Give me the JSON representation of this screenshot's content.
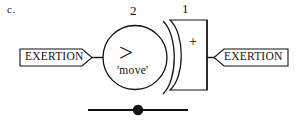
{
  "figure": {
    "label": "c.",
    "caption": ""
  },
  "blocks": {
    "exertion_left": {
      "label": "EXERTION",
      "shape": "right-pointing-flag",
      "x": 20,
      "y": 49,
      "w": 72,
      "h": 17
    },
    "exertion_right": {
      "label": "EXERTION",
      "shape": "left-notched-flag",
      "x": 214,
      "y": 49,
      "w": 74,
      "h": 17
    }
  },
  "element": {
    "circle": {
      "port_number": "2",
      "operator": ">",
      "name": "'move'",
      "cx": 135,
      "cy": 57,
      "r": 32
    },
    "bracket_block": {
      "port_number": "1",
      "sign": "+",
      "x": 160,
      "y": 20,
      "w": 47,
      "h": 70
    }
  },
  "ground": {
    "line_label": "",
    "x1": 88,
    "x2": 188,
    "y": 110,
    "dot_x": 138,
    "dot_r": 5
  },
  "colors": {
    "stroke": "#111111",
    "background": "#ffffff",
    "text": "#111111"
  }
}
